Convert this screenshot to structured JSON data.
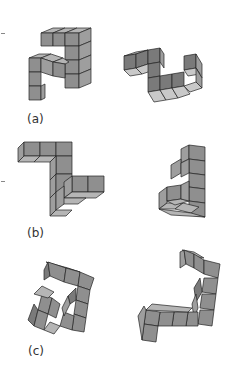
{
  "figure": {
    "pairs": [
      {
        "label": "(a)",
        "description": "Pair of 3D block figures, left: arch-like shape, right: zigzag shape"
      },
      {
        "label": "(b)",
        "description": "Pair of 3D block figures, left: Z-like shape, right: L-shaped tower"
      },
      {
        "label": "(c)",
        "description": "Pair of 3D block figures, left: hook shape, right: J-like shape"
      }
    ],
    "colors": {
      "face_top": "#b5b5b5",
      "face_front": "#8f8f8f",
      "face_side": "#9e9e9e",
      "edge": "#222222",
      "background": "#ffffff"
    }
  }
}
